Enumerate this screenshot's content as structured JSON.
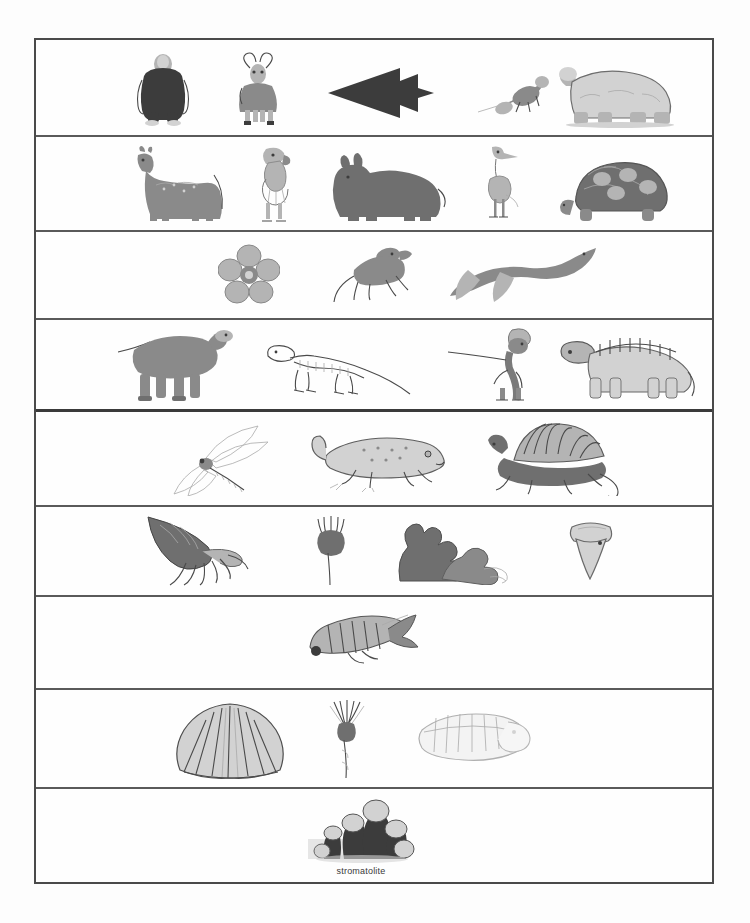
{
  "figure": {
    "type": "geologic-time-fossil-chart",
    "background_color": "#fdfdfd",
    "frame_color": "#4a4a4a",
    "divider_color": "#5a5a5a"
  },
  "rows": [
    {
      "index": 0,
      "row_name": "quaternary-ice-age-row",
      "height": 97,
      "organisms": [
        {
          "name": "gorilla",
          "label": "",
          "x": 96,
          "w": 62,
          "h": 76,
          "icon": "gorilla-figure"
        },
        {
          "name": "bighorn-sheep",
          "label": "",
          "x": 190,
          "w": 64,
          "h": 74,
          "icon": "horned-sheep-figure"
        },
        {
          "name": "stone-arrowhead",
          "label": "",
          "x": 290,
          "w": 110,
          "h": 58,
          "icon": "arrowhead-artifact"
        },
        {
          "name": "small-mammal-lizard",
          "label": "",
          "x": 440,
          "w": 80,
          "h": 52,
          "icon": "small-quadruped-figure"
        },
        {
          "name": "giant-ground-sloth",
          "label": "",
          "x": 518,
          "w": 130,
          "h": 76,
          "icon": "ground-sloth-figure"
        }
      ]
    },
    {
      "index": 1,
      "row_name": "tertiary-mammals-row",
      "height": 95,
      "organisms": [
        {
          "name": "early-horse",
          "label": "",
          "x": 90,
          "w": 100,
          "h": 80,
          "icon": "horse-figure"
        },
        {
          "name": "terror-bird",
          "label": "",
          "x": 208,
          "w": 52,
          "h": 80,
          "icon": "terror-bird-figure"
        },
        {
          "name": "brontothere",
          "label": "",
          "x": 290,
          "w": 120,
          "h": 72,
          "icon": "brontothere-figure"
        },
        {
          "name": "crane-bird",
          "label": "",
          "x": 440,
          "w": 48,
          "h": 78,
          "icon": "crane-figure"
        },
        {
          "name": "giant-tortoise",
          "label": "",
          "x": 518,
          "w": 120,
          "h": 70,
          "icon": "tortoise-figure"
        }
      ]
    },
    {
      "index": 2,
      "row_name": "cretaceous-row",
      "height": 88,
      "organisms": [
        {
          "name": "first-flowering-plant",
          "label": "",
          "x": 182,
          "w": 62,
          "h": 62,
          "icon": "flower-figure"
        },
        {
          "name": "early-mammal",
          "label": "",
          "x": 292,
          "w": 90,
          "h": 64,
          "icon": "early-mammal-figure"
        },
        {
          "name": "plesiosaur",
          "label": "",
          "x": 412,
          "w": 150,
          "h": 62,
          "icon": "plesiosaur-figure"
        }
      ]
    },
    {
      "index": 3,
      "row_name": "jurassic-dinosaurs-row",
      "height": 92,
      "organisms": [
        {
          "name": "sauropod-dinosaur",
          "label": "",
          "x": 80,
          "w": 120,
          "h": 78,
          "icon": "sauropod-figure"
        },
        {
          "name": "dinosaur-skeleton",
          "label": "",
          "x": 228,
          "w": 150,
          "h": 68,
          "icon": "dinosaur-skeleton-figure"
        },
        {
          "name": "crested-theropod-dinosaur",
          "label": "",
          "x": 408,
          "w": 110,
          "h": 78,
          "icon": "crested-theropod-figure"
        },
        {
          "name": "armored-dinosaur",
          "label": "",
          "x": 520,
          "w": 140,
          "h": 72,
          "icon": "armored-dinosaur-figure"
        }
      ]
    },
    {
      "index": 4,
      "row_name": "permian-row",
      "height": 95,
      "organisms": [
        {
          "name": "giant-dragonfly",
          "label": "",
          "x": 130,
          "w": 120,
          "h": 72,
          "icon": "dragonfly-figure"
        },
        {
          "name": "early-amphibian",
          "label": "",
          "x": 272,
          "w": 140,
          "h": 62,
          "icon": "amphibian-figure"
        },
        {
          "name": "dimetrodon",
          "label": "",
          "x": 448,
          "w": 140,
          "h": 76,
          "icon": "dimetrodon-figure"
        }
      ]
    },
    {
      "index": 5,
      "row_name": "devonian-marine-row",
      "height": 90,
      "organisms": [
        {
          "name": "nautiloid-cephalopod",
          "label": "",
          "x": 110,
          "w": 140,
          "h": 72,
          "icon": "nautiloid-figure"
        },
        {
          "name": "crinoid",
          "label": "",
          "x": 272,
          "w": 46,
          "h": 72,
          "icon": "crinoid-figure"
        },
        {
          "name": "coral-colony",
          "label": "",
          "x": 348,
          "w": 130,
          "h": 66,
          "icon": "coral-figure"
        },
        {
          "name": "shark-tooth",
          "label": "",
          "x": 530,
          "w": 50,
          "h": 62,
          "icon": "shark-tooth-figure"
        }
      ]
    },
    {
      "index": 6,
      "row_name": "silurian-fish-row",
      "height": 93,
      "organisms": [
        {
          "name": "armored-fish",
          "label": "",
          "x": 268,
          "w": 130,
          "h": 58,
          "icon": "armored-fish-figure"
        }
      ]
    },
    {
      "index": 7,
      "row_name": "cambrian-row",
      "height": 99,
      "organisms": [
        {
          "name": "brachiopod-shell",
          "label": "",
          "x": 140,
          "w": 110,
          "h": 78,
          "icon": "brachiopod-figure"
        },
        {
          "name": "sea-pen",
          "label": "",
          "x": 288,
          "w": 46,
          "h": 80,
          "icon": "sea-pen-figure"
        },
        {
          "name": "trilobite",
          "label": "",
          "x": 380,
          "w": 120,
          "h": 58,
          "icon": "trilobite-figure"
        }
      ]
    },
    {
      "index": 8,
      "row_name": "precambrian-row",
      "height": 95,
      "organisms": [
        {
          "name": "stromatolite",
          "label": "stromatolite",
          "x": 270,
          "w": 110,
          "h": 70,
          "icon": "stromatolite-figure"
        }
      ]
    }
  ]
}
